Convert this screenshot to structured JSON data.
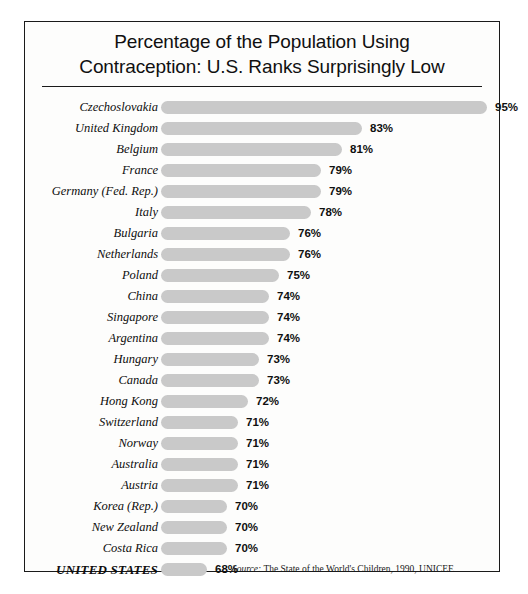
{
  "chart_data": {
    "type": "bar",
    "title": "Percentage of the Population Using Contraception: U.S. Ranks Surprisingly Low",
    "title_lines": [
      "Percentage of the Population Using",
      "Contraception: U.S. Ranks Surprisingly Low"
    ],
    "orientation": "horizontal",
    "xlabel": "",
    "ylabel": "",
    "grid": false,
    "legend": null,
    "value_suffix": "%",
    "axis_note": "Bar lengths use a suppressed (non-zero) baseline; drawn scale begins near 63%.",
    "baseline_percent": 63.6,
    "xlim": [
      63.6,
      95
    ],
    "categories": [
      "Czechoslovakia",
      "United Kingdom",
      "Belgium",
      "France",
      "Germany (Fed. Rep.)",
      "Italy",
      "Bulgaria",
      "Netherlands",
      "Poland",
      "China",
      "Singapore",
      "Argentina",
      "Hungary",
      "Canada",
      "Hong Kong",
      "Switzerland",
      "Norway",
      "Australia",
      "Austria",
      "Korea (Rep.)",
      "New Zealand",
      "Costa Rica",
      "UNITED STATES"
    ],
    "values": [
      95,
      83,
      81,
      79,
      79,
      78,
      76,
      76,
      75,
      74,
      74,
      74,
      73,
      73,
      72,
      71,
      71,
      71,
      71,
      70,
      70,
      70,
      68
    ],
    "value_labels": [
      "95%",
      "83%",
      "81%",
      "79%",
      "79%",
      "78%",
      "76%",
      "76%",
      "75%",
      "74%",
      "74%",
      "74%",
      "73%",
      "73%",
      "72%",
      "71%",
      "71%",
      "71%",
      "71%",
      "70%",
      "70%",
      "70%",
      "68%"
    ],
    "highlighted_category": "UNITED STATES",
    "bar_color": "#c9c9c9",
    "text_color": "#101010"
  },
  "source": {
    "label": "Source:",
    "text": "The State of the World's Children, 1990, UNICEF."
  }
}
